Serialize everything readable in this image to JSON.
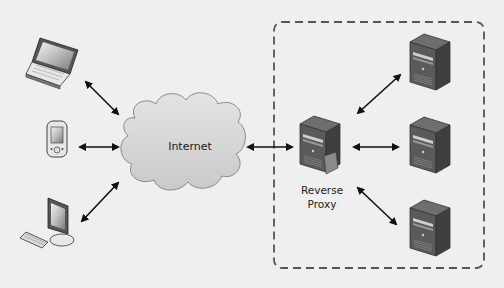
{
  "diagram": {
    "type": "network-architecture",
    "background_color": "#efefef",
    "clients": [
      {
        "id": "laptop",
        "icon": "laptop-icon"
      },
      {
        "id": "mobile",
        "icon": "mobile-phone-icon"
      },
      {
        "id": "desktop",
        "icon": "desktop-computer-icon"
      }
    ],
    "cloud": {
      "label": "Internet",
      "icon": "cloud-icon",
      "fill": "#d6d6d6"
    },
    "proxy": {
      "label_line1": "Reverse",
      "label_line2": "Proxy",
      "icon": "server-icon"
    },
    "backend_servers": [
      {
        "id": "server-1",
        "icon": "server-icon"
      },
      {
        "id": "server-2",
        "icon": "server-icon"
      },
      {
        "id": "server-3",
        "icon": "server-icon"
      }
    ],
    "group_boundary": {
      "style": "dashed",
      "color": "#555555"
    },
    "connections": [
      {
        "from": "laptop",
        "to": "Internet",
        "bidirectional": true
      },
      {
        "from": "mobile",
        "to": "Internet",
        "bidirectional": true
      },
      {
        "from": "desktop",
        "to": "Internet",
        "bidirectional": true
      },
      {
        "from": "Internet",
        "to": "Reverse Proxy",
        "bidirectional": true
      },
      {
        "from": "Reverse Proxy",
        "to": "server-1",
        "bidirectional": true
      },
      {
        "from": "Reverse Proxy",
        "to": "server-2",
        "bidirectional": true
      },
      {
        "from": "Reverse Proxy",
        "to": "server-3",
        "bidirectional": true
      }
    ]
  }
}
